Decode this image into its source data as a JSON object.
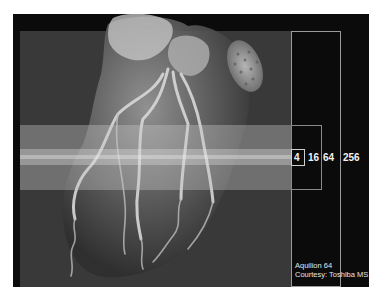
{
  "figure": {
    "coverage_labels": [
      "4",
      "16",
      "64",
      "256"
    ],
    "credit": {
      "line1": "Aquilion 64",
      "line2": "Courtesy: Toshiba MS"
    }
  },
  "colors": {
    "background": "#0b0b0b",
    "panel": "#393939",
    "label_text": "#f2f2f2",
    "box_border": "#8a8a8a"
  }
}
